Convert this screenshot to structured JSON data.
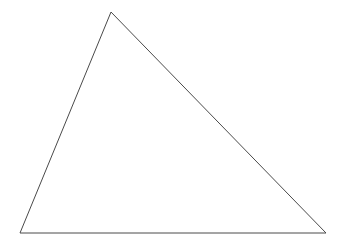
{
  "canvas": {
    "width": 348,
    "height": 249,
    "background_color": "#ffffff",
    "title": "triangle-figure"
  },
  "figure": {
    "name": "triangle",
    "type": "polygon",
    "stroke_color": "#4a4a4a",
    "stroke_width": 1,
    "fill": "none",
    "closed": true,
    "vertex_count": 3,
    "vertices": [
      {
        "label": "apex",
        "x": 111,
        "y": 12
      },
      {
        "label": "bottom-right",
        "x": 326,
        "y": 233
      },
      {
        "label": "bottom-left",
        "x": 20,
        "y": 233
      }
    ],
    "points_attr": "111,12 326,233 20,233",
    "edges": [
      {
        "name": "left-edge",
        "from": "bottom-left",
        "to": "apex"
      },
      {
        "name": "right-edge",
        "from": "apex",
        "to": "bottom-right"
      },
      {
        "name": "base-edge",
        "from": "bottom-left",
        "to": "bottom-right"
      }
    ]
  },
  "labels": {
    "text_present": "none"
  }
}
